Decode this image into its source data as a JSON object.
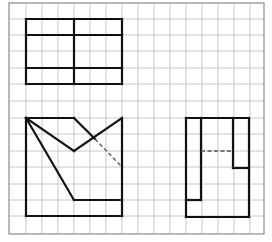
{
  "diagram": {
    "type": "orthographic-projection-views",
    "background": "#ffffff",
    "grid": {
      "left": 9,
      "top": 3,
      "right": 264,
      "bottom": 234,
      "x_lines": [
        26,
        42,
        58,
        74,
        90,
        106,
        122,
        138,
        154,
        170,
        186,
        202,
        218,
        234,
        250
      ],
      "y_lines": [
        19,
        35,
        51,
        68,
        84,
        101,
        118,
        134,
        151,
        167,
        184,
        200,
        216
      ],
      "color": "#c8c8c8",
      "border_color": "#8a8a8a"
    },
    "stroke": {
      "color": "#111111",
      "width": 2.2,
      "dash_color": "#555555"
    },
    "views": [
      {
        "name": "top-view",
        "solid_segments": [
          [
            26,
            19,
            122,
            19
          ],
          [
            26,
            84,
            122,
            84
          ],
          [
            26,
            19,
            26,
            84
          ],
          [
            122,
            19,
            122,
            84
          ],
          [
            26,
            35,
            122,
            35
          ],
          [
            26,
            68,
            122,
            68
          ],
          [
            74,
            19,
            74,
            84
          ]
        ],
        "dashed_segments": []
      },
      {
        "name": "front-view",
        "solid_segments": [
          [
            26,
            118,
            26,
            216
          ],
          [
            26,
            216,
            122,
            216
          ],
          [
            122,
            118,
            122,
            216
          ],
          [
            26,
            118,
            74,
            118
          ],
          [
            74,
            118,
            95,
            139
          ],
          [
            26,
            118,
            74,
            151
          ],
          [
            74,
            151,
            122,
            118
          ],
          [
            26,
            118,
            74,
            200
          ],
          [
            74,
            200,
            122,
            200
          ]
        ],
        "dashed_segments": [
          [
            95,
            139,
            122,
            167
          ]
        ]
      },
      {
        "name": "side-view",
        "solid_segments": [
          [
            186,
            118,
            249,
            118
          ],
          [
            186,
            118,
            186,
            217
          ],
          [
            186,
            217,
            249,
            217
          ],
          [
            249,
            118,
            249,
            217
          ],
          [
            201,
            118,
            201,
            200
          ],
          [
            186,
            200,
            201,
            200
          ],
          [
            233,
            118,
            233,
            168
          ],
          [
            233,
            168,
            249,
            168
          ]
        ],
        "dashed_segments": [
          [
            201,
            151,
            233,
            151
          ]
        ]
      }
    ]
  }
}
